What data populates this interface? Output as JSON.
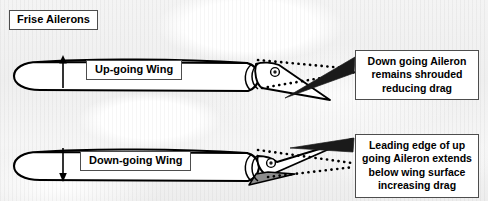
{
  "diagram": {
    "title": "Frise Ailerons",
    "background": "cloudy sky",
    "line_color": "#000000",
    "shade_color": "#8c8c8c",
    "box_border_color": "#4d4d4d",
    "box_fill_color": "#ffffff"
  },
  "wings": [
    {
      "id": "upper",
      "label": "Up-going Wing",
      "arrow": "up-arrow",
      "arrow_direction": "up",
      "aileron_state": "down going aileron, shrouded",
      "hinge": "hinge-pivot"
    },
    {
      "id": "lower",
      "label": "Down-going Wing",
      "arrow": "down-arrow",
      "arrow_direction": "down",
      "aileron_state": "up going aileron, leading edge protrudes below wing surface",
      "hinge": "hinge-pivot",
      "shaded_region": "protruding aileron leading edge"
    }
  ],
  "callouts": [
    {
      "id": "top",
      "lines": [
        "Down going Aileron",
        "remains shrouded",
        "reducing drag"
      ],
      "text": "Down going Aileron remains shrouded reducing drag",
      "points_to": "upper aileron trailing edge"
    },
    {
      "id": "bottom",
      "lines": [
        "Leading edge of up",
        "going Aileron extends",
        "below wing surface",
        "increasing drag"
      ],
      "text": "Leading edge of up going Aileron extends below wing surface increasing drag",
      "points_to": "lower aileron leading edge"
    }
  ]
}
